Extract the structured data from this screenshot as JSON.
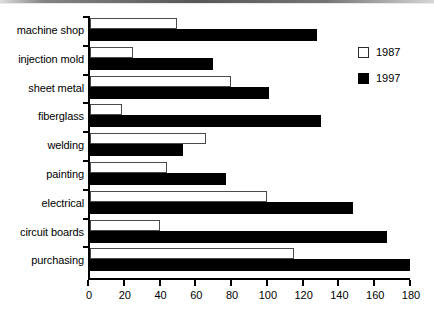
{
  "chart_data": {
    "type": "bar",
    "orientation": "horizontal",
    "title": "",
    "xlabel": "",
    "ylabel": "",
    "xlim": [
      0,
      180
    ],
    "xticks": [
      0,
      20,
      40,
      60,
      80,
      100,
      120,
      140,
      160,
      180
    ],
    "grid": false,
    "legend_position": "right",
    "categories": [
      "machine shop",
      "injection mold",
      "sheet metal",
      "fiberglass",
      "welding",
      "painting",
      "electrical",
      "circuit boards",
      "purchasing"
    ],
    "series": [
      {
        "name": "1987",
        "color": "#ffffff",
        "values": [
          50,
          25,
          80,
          19,
          66,
          44,
          100,
          40,
          115
        ]
      },
      {
        "name": "1997",
        "color": "#000000",
        "values": [
          128,
          70,
          101,
          130,
          53,
          77,
          148,
          167,
          180
        ]
      }
    ]
  },
  "legend": {
    "items": [
      {
        "label": "1987",
        "swatch": "hollow-square-icon"
      },
      {
        "label": "1997",
        "swatch": "filled-square-icon"
      }
    ]
  }
}
